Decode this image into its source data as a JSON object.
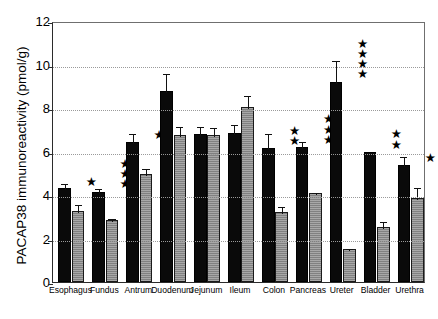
{
  "chart_data": {
    "type": "bar",
    "title": "",
    "xlabel": "",
    "ylabel": "PACAP38 immunoreactivity (pmol/g)",
    "ylim": [
      0,
      12
    ],
    "yticks": [
      0,
      2,
      4,
      6,
      8,
      10,
      12
    ],
    "ytick_labels": [
      "0",
      "2",
      "4",
      "6",
      "8",
      "10",
      "12"
    ],
    "grid": "horizontal-dotted",
    "legend": "none",
    "categories": [
      "Esophagus",
      "Fundus",
      "Antrum",
      "Duodenum",
      "Jejunum",
      "Ileum",
      "Colon",
      "Pancreas",
      "Ureter",
      "Bladder",
      "Urethra"
    ],
    "series": [
      {
        "name": "black",
        "values": [
          4.3,
          4.15,
          6.45,
          8.8,
          6.8,
          6.85,
          6.15,
          6.2,
          9.2,
          6.0,
          5.4
        ],
        "errors": [
          0.3,
          0.2,
          0.45,
          0.85,
          0.4,
          0.45,
          0.75,
          0.35,
          1.05,
          0.0,
          0.45
        ]
      },
      {
        "name": "gray",
        "values": [
          3.25,
          2.85,
          4.95,
          6.75,
          6.75,
          8.05,
          3.2,
          4.1,
          1.5,
          2.55,
          3.85
        ],
        "errors": [
          0.4,
          0.15,
          0.35,
          0.45,
          0.4,
          0.6,
          0.35,
          0.1,
          0.12,
          0.3,
          0.55
        ]
      }
    ],
    "significance_stars": [
      1,
      3,
      1,
      0,
      0,
      0,
      2,
      3,
      4,
      2,
      1
    ],
    "star_glyph": "★",
    "colors": {
      "series_black": "#0a0a0a",
      "series_gray": "#8f8f8f",
      "axis": "#2b2b2b",
      "grid": "#9a9a9a",
      "text": "#000000",
      "background": "#ffffff"
    }
  }
}
